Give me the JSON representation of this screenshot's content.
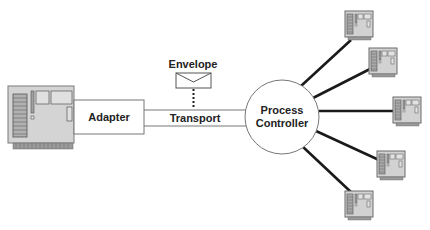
{
  "diagram": {
    "adapter_label": "Adapter",
    "transport_label": "Transport",
    "envelope_label": "Envelope",
    "controller_label_line1": "Process",
    "controller_label_line2": "Controller",
    "device_count": 5
  },
  "colors": {
    "board_fill": "#d4d4d4",
    "board_stroke": "#6e6e6e",
    "line": "#1a1a1a"
  }
}
